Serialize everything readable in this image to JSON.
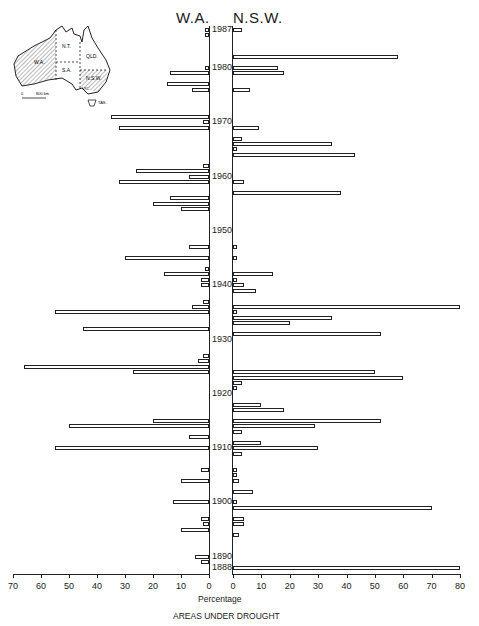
{
  "chart_data": {
    "type": "bar",
    "orientation": "horizontal-back-to-back",
    "title": "AREAS UNDER DROUGHT",
    "xlabel": "Percentage",
    "ylabel": "",
    "left_series_label": "W.A.",
    "right_series_label": "N.S.W.",
    "left_xlim": [
      0,
      70
    ],
    "right_xlim": [
      0,
      80
    ],
    "left_ticks": [
      70,
      60,
      50,
      40,
      30,
      20,
      10,
      0
    ],
    "right_ticks": [
      0,
      10,
      20,
      30,
      40,
      50,
      60,
      70,
      80
    ],
    "year_labels": [
      "1987",
      "1980",
      "1970",
      "1960",
      "1950",
      "1940",
      "1930",
      "1920",
      "1910",
      "1900",
      "1890",
      "1888"
    ],
    "map_inset": {
      "regions": [
        "W.A.",
        "N.T.",
        "QLD.",
        "S.A.",
        "N.S.W.",
        "VIC.",
        "TAS."
      ],
      "scale_label": "800 km",
      "scale_zero": "0",
      "shaded": [
        "W.A.",
        "N.S.W."
      ]
    },
    "categories": [
      1987,
      1986,
      1985,
      1984,
      1983,
      1982,
      1981,
      1980,
      1979,
      1978,
      1977,
      1976,
      1975,
      1974,
      1973,
      1972,
      1971,
      1970,
      1969,
      1968,
      1967,
      1966,
      1965,
      1964,
      1963,
      1962,
      1961,
      1960,
      1959,
      1958,
      1957,
      1956,
      1955,
      1954,
      1953,
      1952,
      1951,
      1950,
      1949,
      1948,
      1947,
      1946,
      1945,
      1944,
      1943,
      1942,
      1941,
      1940,
      1939,
      1938,
      1937,
      1936,
      1935,
      1934,
      1933,
      1932,
      1931,
      1930,
      1929,
      1928,
      1927,
      1926,
      1925,
      1924,
      1923,
      1922,
      1921,
      1920,
      1919,
      1918,
      1917,
      1916,
      1915,
      1914,
      1913,
      1912,
      1911,
      1910,
      1909,
      1908,
      1907,
      1906,
      1905,
      1904,
      1903,
      1902,
      1901,
      1900,
      1899,
      1898,
      1897,
      1896,
      1895,
      1894,
      1893,
      1892,
      1891,
      1890,
      1889,
      1888
    ],
    "series": [
      {
        "name": "W.A.",
        "values": [
          1,
          1,
          0,
          0,
          0,
          0,
          0,
          1,
          14,
          0,
          15,
          6,
          0,
          0,
          0,
          0,
          35,
          2,
          32,
          0,
          0,
          0,
          0,
          0,
          0,
          2,
          26,
          7,
          32,
          0,
          0,
          14,
          20,
          10,
          0,
          0,
          0,
          0,
          0,
          0,
          7,
          0,
          30,
          0,
          1,
          16,
          3,
          3,
          0,
          0,
          2,
          6,
          55,
          0,
          0,
          45,
          0,
          0,
          0,
          0,
          2,
          4,
          66,
          27,
          0,
          0,
          0,
          0,
          0,
          0,
          0,
          0,
          20,
          50,
          0,
          7,
          0,
          55,
          0,
          0,
          0,
          3,
          0,
          10,
          0,
          0,
          0,
          13,
          0,
          0,
          3,
          2,
          10,
          0,
          0,
          0,
          0,
          5,
          3,
          0
        ]
      },
      {
        "name": "N.S.W.",
        "values": [
          3,
          0,
          0,
          0,
          0,
          58,
          0,
          16,
          18,
          0,
          0,
          6,
          0,
          0,
          0,
          0,
          0,
          0,
          9,
          0,
          3,
          35,
          1,
          43,
          0,
          0,
          0,
          0,
          4,
          0,
          38,
          0,
          0,
          0,
          0,
          0,
          0,
          0,
          0,
          0,
          1,
          0,
          1,
          0,
          0,
          14,
          1,
          4,
          8,
          0,
          0,
          80,
          1,
          35,
          20,
          0,
          52,
          0,
          0,
          0,
          0,
          0,
          0,
          50,
          60,
          3,
          1,
          0,
          0,
          10,
          18,
          0,
          52,
          29,
          3,
          0,
          10,
          30,
          3,
          0,
          0,
          1,
          1,
          2,
          0,
          7,
          0,
          1,
          70,
          0,
          4,
          4,
          0,
          2,
          0,
          0,
          0,
          0,
          0,
          80
        ]
      }
    ]
  },
  "labels": {
    "wa": "W.A.",
    "nsw": "N.S.W.",
    "xlabel": "Percentage",
    "title": "AREAS UNDER DROUGHT"
  }
}
